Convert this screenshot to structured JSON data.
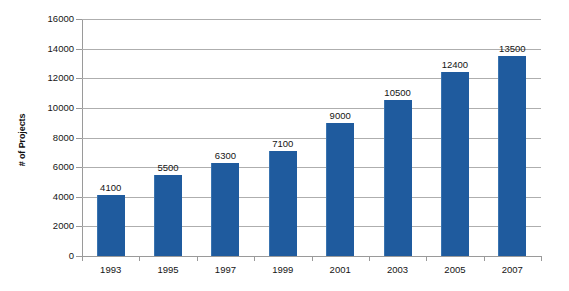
{
  "chart_data": {
    "type": "bar",
    "title": "",
    "xlabel": "",
    "ylabel": "# of Projects",
    "categories": [
      "1993",
      "1995",
      "1997",
      "1999",
      "2001",
      "2003",
      "2005",
      "2007"
    ],
    "values": [
      4100,
      5500,
      6300,
      7100,
      9000,
      10500,
      12400,
      13500
    ],
    "data_labels": [
      "4100",
      "5500",
      "6300",
      "7100",
      "9000",
      "10500",
      "12400",
      "13500"
    ],
    "ylim": [
      0,
      16000
    ],
    "ytick_values": [
      0,
      2000,
      4000,
      6000,
      8000,
      10000,
      12000,
      14000,
      16000
    ],
    "ytick_labels": [
      "0",
      "2000",
      "4000",
      "6000",
      "8000",
      "10000",
      "12000",
      "14000",
      "16000"
    ],
    "grid": true,
    "grid_axis": "y",
    "legend": false,
    "legend_position": "none",
    "series": [
      {
        "name": "# of Projects",
        "color": "#1f5b9e",
        "values": [
          4100,
          5500,
          6300,
          7100,
          9000,
          10500,
          12400,
          13500
        ]
      }
    ],
    "colors": {
      "bar": "#1f5b9e",
      "bar_edge": "#3a74b0",
      "gridline": "#aeaeae",
      "axis": "#9a9a9a",
      "text": "#141414",
      "background": "#ffffff"
    }
  }
}
